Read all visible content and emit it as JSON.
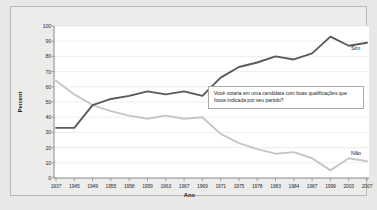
{
  "chart_data": {
    "type": "line",
    "title": "",
    "xlabel": "Ano",
    "ylabel": "Percent",
    "ylim": [
      0,
      100
    ],
    "ytick_values": [
      0,
      10,
      20,
      30,
      40,
      50,
      60,
      70,
      80,
      90,
      100
    ],
    "categories": [
      "1937",
      "1945",
      "1949",
      "1955",
      "1958",
      "1959",
      "1963",
      "1967",
      "1969",
      "1971",
      "1975",
      "1978",
      "1983",
      "1984",
      "1987",
      "1999",
      "2003",
      "2007"
    ],
    "grid": "horizontal",
    "legend": "inline-end-labels",
    "series": [
      {
        "name": "Sim",
        "color": "#5a5a5a",
        "values": [
          33,
          33,
          48,
          52,
          54,
          57,
          55,
          57,
          54,
          66,
          73,
          76,
          80,
          78,
          82,
          93,
          87,
          89
        ]
      },
      {
        "name": "Não",
        "color": "#c6c6c4",
        "values": [
          64,
          55,
          48,
          44,
          41,
          39,
          41,
          39,
          40,
          29,
          23,
          19,
          16,
          17,
          13,
          5,
          13,
          11
        ]
      }
    ],
    "annotations": [
      {
        "name": "poll-question",
        "text": "Você votaria em uma candidata com boas qualificações que fosse indicada por seu partido?"
      }
    ]
  },
  "axis": {
    "y_title": "Percent",
    "x_title": "Ano"
  },
  "labels": {
    "sim": "Sim",
    "nao": "Não"
  }
}
